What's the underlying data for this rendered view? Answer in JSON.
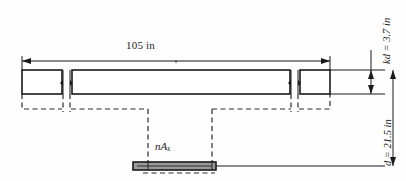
{
  "figure": {
    "type": "engineering-section-diagram",
    "labels": {
      "flange_width": "105 in",
      "neutral_axis_depth": "kd = 3.7 in",
      "neutral_axis_depth_symbol": "kd",
      "neutral_axis_depth_value": "3.7 in",
      "effective_depth": "d = 21.5 in",
      "effective_depth_symbol": "d",
      "effective_depth_value": "21.5 in",
      "steel_area_symbol": "nA",
      "steel_area_subscript": "s",
      "steel_area_full": "nAs"
    },
    "colors": {
      "line": "#1a1a1a",
      "steel_fill": "#9a9a9a",
      "background": "#ffffff",
      "dashed": "#2a2a2a"
    },
    "dimensions": {
      "flange_top_y": 70,
      "flange_bottom_y": 94,
      "steel_level_y": 166,
      "left_edge_x": 22,
      "right_edge_x": 330
    }
  }
}
